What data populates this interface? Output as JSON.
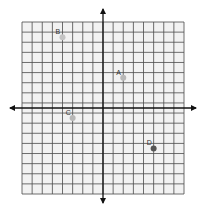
{
  "chart_data": {
    "type": "scatter",
    "title": "",
    "xlabel": "",
    "ylabel": "",
    "grid": true,
    "grid_cols": 16,
    "grid_rows": 17,
    "xlim": [
      -8,
      8
    ],
    "ylim": [
      -8.5,
      8.5
    ],
    "points": [
      {
        "label": "A",
        "x": 2,
        "y": 3,
        "color": "#b8b8b8"
      },
      {
        "label": "B",
        "x": -4,
        "y": 7,
        "color": "#c4c4c4"
      },
      {
        "label": "C",
        "x": -3,
        "y": -1,
        "color": "#b8b8b8"
      },
      {
        "label": "D",
        "x": 5,
        "y": -4,
        "color": "#555555"
      }
    ]
  },
  "colors": {
    "grid_line": "#4a4a4a",
    "grid_fill": "#f2f2f2",
    "axis": "#111111"
  }
}
